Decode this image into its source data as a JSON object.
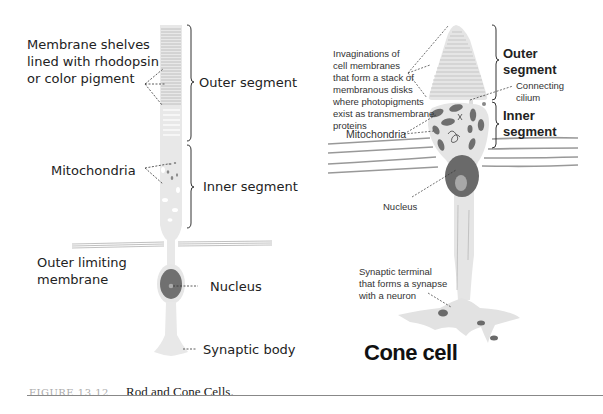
{
  "figure": {
    "number": "FIGURE 13.12",
    "caption": "Rod and Cone Cells."
  },
  "rod": {
    "labels": {
      "membrane_shelves": [
        "Membrane shelves",
        "lined with rhodopsin",
        "or color pigment"
      ],
      "outer_segment": "Outer segment",
      "mitochondria": "Mitochondria",
      "inner_segment": "Inner segment",
      "outer_limiting_membrane": [
        "Outer limiting",
        "membrane"
      ],
      "nucleus": "Nucleus",
      "synaptic_body": "Synaptic body"
    }
  },
  "cone": {
    "title": "Cone cell",
    "labels": {
      "invaginations": [
        "Invaginations of",
        "cell membranes",
        "that form a stack of",
        "membranous disks",
        "where photopigments",
        "exist as transmembrane",
        "proteins"
      ],
      "outer_segment": [
        "Outer",
        "segment"
      ],
      "connecting_cilium": [
        "Connecting",
        "cilium"
      ],
      "inner_segment": [
        "Inner",
        "segment"
      ],
      "mitochondria": "Mitochondria",
      "nucleus": "Nucleus",
      "synaptic_terminal": [
        "Synaptic terminal",
        "that forms a synapse",
        "with a neuron"
      ]
    }
  },
  "colors": {
    "cell_fill": "#e6e6e6",
    "nucleus_fill": "#6a6a6a",
    "membrane_lines": "#9a9a9a",
    "text": "#222222",
    "caption_number": "#aaaaaa"
  }
}
